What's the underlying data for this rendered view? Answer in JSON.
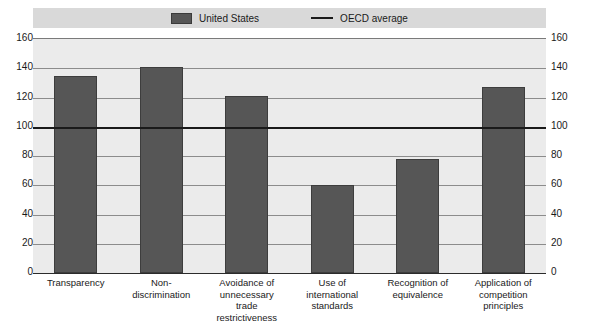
{
  "chart_data": {
    "type": "bar",
    "title": "",
    "subtitle": "",
    "xlabel": "",
    "ylabel": "",
    "ylim": [
      0,
      160
    ],
    "yticks": [
      0,
      20,
      40,
      60,
      80,
      100,
      120,
      140,
      160
    ],
    "grid": true,
    "dual_y_axis": true,
    "legend_position": "top-center",
    "categories": [
      "Transparency",
      "Non-discrimination",
      "Avoidance of unnecessary trade restrictiveness",
      "Use of international standards",
      "Recognition of equivalence",
      "Application of competition principles"
    ],
    "category_label_lines": [
      [
        "Transparency"
      ],
      [
        "Non-",
        "discrimination"
      ],
      [
        "Avoidance of",
        "unnecessary",
        "trade restrictiveness"
      ],
      [
        "Use of international",
        "standards"
      ],
      [
        "Recognition of",
        "equivalence"
      ],
      [
        "Application of",
        "competition",
        "principles"
      ]
    ],
    "series": [
      {
        "name": "United States",
        "type": "bar",
        "color": "#565656",
        "values": [
          135,
          141,
          121,
          60,
          78,
          127
        ]
      },
      {
        "name": "OECD average",
        "type": "line",
        "color": "#1a1a1a",
        "value": 100
      }
    ]
  },
  "legend": {
    "items": [
      {
        "label": "United States",
        "marker": "bar-swatch"
      },
      {
        "label": "OECD average",
        "marker": "line-swatch"
      }
    ]
  },
  "colors": {
    "bar_fill": "#565656",
    "reference_line": "#1a1a1a",
    "plot_background": "#ebebeb",
    "legend_background": "#d9d9d9",
    "gridline": "#8c8c8c",
    "page_background": "#ffffff"
  }
}
